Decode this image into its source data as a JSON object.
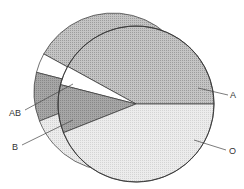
{
  "chart_data": {
    "type": "pie",
    "style": "3d-extruded",
    "title": "",
    "categories": [
      "A",
      "AB",
      "B",
      "O"
    ],
    "values": [
      42,
      4,
      10,
      44
    ],
    "colors": {
      "A": "#b8b8b8",
      "AB": "#ffffff",
      "B": "#9a9a9a",
      "O": "#e4e4e4"
    },
    "start_angle_deg": 0,
    "direction": "counterclockwise",
    "legend": "none",
    "labels_position": "outside-with-leader-lines"
  },
  "labels": {
    "A": "A",
    "AB": "AB",
    "B": "B",
    "O": "O"
  }
}
